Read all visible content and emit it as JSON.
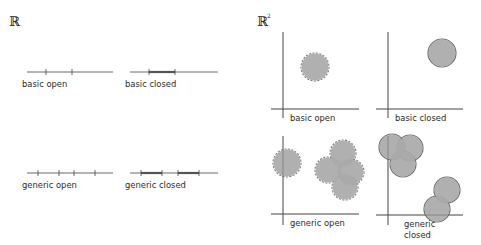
{
  "titles": {
    "left": "ℝ",
    "right": "ℝ",
    "right_sup": "2"
  },
  "colors": {
    "fill": "#a9a9a9",
    "stroke_open": "#777777",
    "stroke_closed": "#6e6e6e",
    "axis": "#555555"
  },
  "one_d": [
    {
      "label": "basic open",
      "y": 72,
      "x0": 27,
      "x1": 113,
      "ticks": [
        46,
        72
      ],
      "segments": []
    },
    {
      "label": "basic closed",
      "y": 72,
      "x0": 130,
      "x1": 218,
      "ticks": [
        149,
        175
      ],
      "segments": [
        [
          149,
          175
        ]
      ]
    },
    {
      "label": "generic open",
      "y": 173,
      "x0": 27,
      "x1": 113,
      "ticks": [
        38,
        59,
        74,
        95
      ],
      "segments": []
    },
    {
      "label": "generic closed",
      "y": 173,
      "x0": 130,
      "x1": 218,
      "ticks": [
        141,
        162,
        178,
        199
      ],
      "segments": [
        [
          141,
          162
        ],
        [
          178,
          199
        ]
      ]
    }
  ],
  "two_d": [
    {
      "label": "basic open",
      "type": "open",
      "vaxis": {
        "x": 283,
        "y0": 32,
        "y1": 118
      },
      "haxis": {
        "y": 109,
        "x0": 271,
        "x1": 359
      },
      "circles": [
        [
          315,
          67,
          14
        ]
      ]
    },
    {
      "label": "basic closed",
      "type": "closed",
      "vaxis": {
        "x": 388,
        "y0": 32,
        "y1": 118
      },
      "haxis": {
        "y": 109,
        "x0": 376,
        "x1": 463
      },
      "circles": [
        [
          442,
          53,
          14
        ]
      ]
    },
    {
      "label": "generic open",
      "type": "open",
      "vaxis": {
        "x": 283,
        "y0": 136,
        "y1": 225
      },
      "haxis": {
        "y": 214,
        "x0": 271,
        "x1": 359
      },
      "circles": [
        [
          287,
          163,
          14
        ],
        [
          343,
          153,
          13
        ],
        [
          328,
          170,
          13
        ],
        [
          351,
          172,
          13
        ],
        [
          345,
          187,
          13
        ]
      ]
    },
    {
      "label": "generic closed",
      "type": "closed",
      "label_lines": [
        "generic",
        "closed"
      ],
      "vaxis": {
        "x": 388,
        "y0": 136,
        "y1": 225
      },
      "haxis": {
        "y": 215,
        "x0": 376,
        "x1": 463
      },
      "circles": [
        [
          392,
          147,
          13
        ],
        [
          410,
          148,
          13
        ],
        [
          403,
          164,
          13
        ],
        [
          447,
          190,
          13
        ],
        [
          437,
          209,
          13
        ]
      ]
    }
  ]
}
